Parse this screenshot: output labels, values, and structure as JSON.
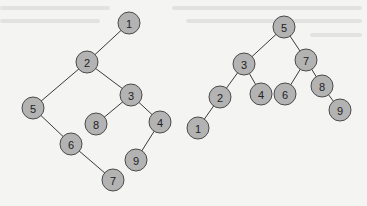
{
  "figure": {
    "colors": {
      "background": "#f4f4f2",
      "node_fill": "#b3b3b3",
      "node_stroke": "#4a4a4a",
      "edge": "#3a3a3a",
      "label": "#222222"
    },
    "node_radius": 11
  },
  "trees": [
    {
      "name": "left-tree",
      "nodes": [
        {
          "id": "L1",
          "label": "1",
          "x": 129,
          "y": 23
        },
        {
          "id": "L2",
          "label": "2",
          "x": 87,
          "y": 62
        },
        {
          "id": "L5",
          "label": "5",
          "x": 33,
          "y": 108
        },
        {
          "id": "L3",
          "label": "3",
          "x": 131,
          "y": 95
        },
        {
          "id": "L8",
          "label": "8",
          "x": 96,
          "y": 124
        },
        {
          "id": "L4",
          "label": "4",
          "x": 160,
          "y": 122
        },
        {
          "id": "L6",
          "label": "6",
          "x": 71,
          "y": 144
        },
        {
          "id": "L9",
          "label": "9",
          "x": 136,
          "y": 160
        },
        {
          "id": "L7",
          "label": "7",
          "x": 113,
          "y": 180
        }
      ],
      "edges": [
        [
          "L1",
          "L2"
        ],
        [
          "L2",
          "L5"
        ],
        [
          "L2",
          "L3"
        ],
        [
          "L3",
          "L8"
        ],
        [
          "L3",
          "L4"
        ],
        [
          "L5",
          "L6"
        ],
        [
          "L6",
          "L7"
        ],
        [
          "L4",
          "L9"
        ]
      ]
    },
    {
      "name": "right-tree",
      "nodes": [
        {
          "id": "R5",
          "label": "5",
          "x": 284,
          "y": 27
        },
        {
          "id": "R3",
          "label": "3",
          "x": 244,
          "y": 64
        },
        {
          "id": "R7",
          "label": "7",
          "x": 306,
          "y": 60
        },
        {
          "id": "R2",
          "label": "2",
          "x": 220,
          "y": 97
        },
        {
          "id": "R4",
          "label": "4",
          "x": 261,
          "y": 94
        },
        {
          "id": "R6",
          "label": "6",
          "x": 285,
          "y": 94
        },
        {
          "id": "R8",
          "label": "8",
          "x": 322,
          "y": 86
        },
        {
          "id": "R1",
          "label": "1",
          "x": 198,
          "y": 128
        },
        {
          "id": "R9",
          "label": "9",
          "x": 340,
          "y": 110
        }
      ],
      "edges": [
        [
          "R5",
          "R3"
        ],
        [
          "R5",
          "R7"
        ],
        [
          "R3",
          "R2"
        ],
        [
          "R3",
          "R4"
        ],
        [
          "R2",
          "R1"
        ],
        [
          "R7",
          "R6"
        ],
        [
          "R7",
          "R8"
        ],
        [
          "R8",
          "R9"
        ]
      ]
    }
  ]
}
